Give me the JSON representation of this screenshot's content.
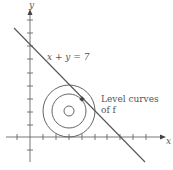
{
  "diagram": {
    "axes": {
      "x_label": "x",
      "y_label": "y"
    },
    "line": {
      "label": "x + y = 7",
      "equation": "x + y = 7"
    },
    "level_curves": {
      "label_line1": "Level curves",
      "label_line2": "of f"
    },
    "colors": {
      "stroke": "#555555",
      "point": "#444444"
    }
  }
}
